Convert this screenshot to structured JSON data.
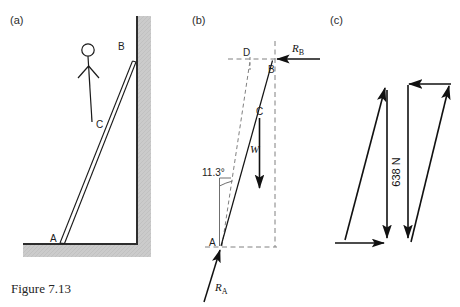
{
  "figure": {
    "caption": "Figure 7.13",
    "panels": [
      {
        "id": "a",
        "label": "(a)"
      },
      {
        "id": "b",
        "label": "(b)"
      },
      {
        "id": "c",
        "label": "(c)"
      }
    ]
  },
  "panel_a": {
    "name": "ladder-against-wall-pictorial",
    "point_labels": {
      "top": "B",
      "middle": "C",
      "bottom": "A"
    },
    "elements": {
      "person": "stick-figure",
      "wall": "vertical-wall-hatched",
      "floor": "horizontal-floor-hatched",
      "ladder": "double-line-ladder"
    },
    "colors": {
      "surface_shade": "#c9c9c9",
      "line": "#1a1a1a"
    }
  },
  "panel_b": {
    "name": "free-body-diagram",
    "point_labels": {
      "top": "B",
      "middle": "C",
      "bottom": "A",
      "projection": "D"
    },
    "forces": [
      {
        "symbol": "R",
        "subscript": "B",
        "label": "R_B",
        "direction": "horizontal-left-at-B"
      },
      {
        "symbol": "W",
        "subscript": "",
        "label": "W",
        "direction": "vertical-down-at-C"
      },
      {
        "symbol": "R",
        "subscript": "A",
        "label": "R_A",
        "direction": "up-right-at-A"
      }
    ],
    "angle": {
      "value": "11.3",
      "unit": "°",
      "label": "11.3°"
    },
    "construction": "dashed-lines",
    "colors": {
      "dash": "#7a7a7a",
      "line": "#111111"
    }
  },
  "panel_c": {
    "name": "triangle-of-forces",
    "magnitude": {
      "value": "638",
      "unit": "N",
      "label": "638 N"
    },
    "triangles": [
      {
        "id": "left",
        "name": "force-triangle-left"
      },
      {
        "id": "right",
        "name": "force-triangle-right"
      }
    ],
    "colors": {
      "line": "#111111"
    }
  }
}
